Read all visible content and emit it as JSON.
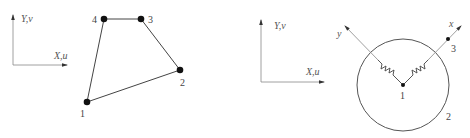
{
  "left_figure": {
    "global_axes": {
      "y_label": "Y,v",
      "x_label": "X,u"
    },
    "element": {
      "type": "quadrilateral",
      "nodes": [
        {
          "id": "1",
          "label": "1"
        },
        {
          "id": "2",
          "label": "2"
        },
        {
          "id": "3",
          "label": "3"
        },
        {
          "id": "4",
          "label": "4"
        }
      ],
      "edges": [
        [
          "1",
          "2"
        ],
        [
          "2",
          "3"
        ],
        [
          "3",
          "4"
        ],
        [
          "4",
          "1"
        ]
      ]
    }
  },
  "right_figure": {
    "global_axes": {
      "y_label": "Y,v",
      "x_label": "X,u"
    },
    "element": {
      "type": "circle-with-springs",
      "local_axes": {
        "x_label": "x",
        "y_label": "y"
      },
      "nodes": [
        {
          "id": "1",
          "label": "1",
          "role": "center"
        },
        {
          "id": "2",
          "label": "2",
          "role": "boundary"
        },
        {
          "id": "3",
          "label": "3",
          "role": "on-local-x-axis"
        }
      ],
      "springs": [
        {
          "along": "y"
        },
        {
          "along": "x"
        }
      ]
    }
  }
}
